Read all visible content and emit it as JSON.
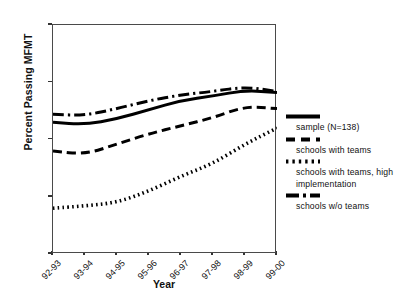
{
  "chart_data": {
    "type": "line",
    "title": "",
    "xlabel": "Year",
    "ylabel": "Percent Passing MFMT",
    "categories": [
      "92-93",
      "93-94",
      "94-95",
      "95-96",
      "96-97",
      "97-98",
      "98-99",
      "99-00"
    ],
    "ylim": [
      60,
      100
    ],
    "yticks": [
      60,
      70,
      80,
      90,
      100
    ],
    "grid": false,
    "legend_position": "right",
    "series": [
      {
        "name": "sample (N=138)",
        "style": "solid",
        "values": [
          83.0,
          82.6,
          83.6,
          85.2,
          86.8,
          87.6,
          88.6,
          88.2
        ]
      },
      {
        "name": "schools with teams",
        "style": "dashed",
        "values": [
          78.0,
          77.4,
          79.2,
          81.0,
          82.4,
          83.8,
          85.8,
          85.4
        ]
      },
      {
        "name": "schools with teams, high implementation",
        "style": "dotted",
        "values": [
          68.0,
          68.4,
          69.0,
          71.0,
          73.6,
          75.8,
          79.2,
          82.0
        ]
      },
      {
        "name": "schools w/o teams",
        "style": "dashdot",
        "values": [
          84.4,
          84.2,
          85.4,
          86.8,
          87.8,
          88.4,
          89.2,
          88.4
        ]
      }
    ]
  },
  "legend": {
    "entries": [
      {
        "label": "sample (N=138)",
        "style": "solid"
      },
      {
        "label": "schools with teams",
        "style": "dashed"
      },
      {
        "label": "schools with teams, high implementation",
        "style": "dotted"
      },
      {
        "label": "schools w/o teams",
        "style": "dashdot"
      }
    ]
  }
}
